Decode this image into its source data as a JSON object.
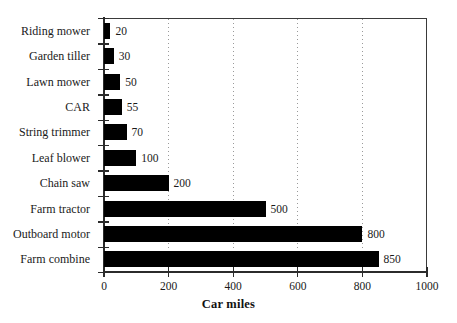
{
  "chart_data": {
    "type": "bar",
    "orientation": "horizontal",
    "title": "",
    "subtitle": "",
    "xlabel": "Car miles",
    "ylabel": "",
    "categories": [
      "Riding mower",
      "Garden tiller",
      "Lawn mower",
      "CAR",
      "String trimmer",
      "Leaf blower",
      "Chain saw",
      "Farm tractor",
      "Outboard motor",
      "Farm combine"
    ],
    "values": [
      20,
      30,
      50,
      55,
      70,
      100,
      200,
      500,
      800,
      850
    ],
    "value_labels": [
      "20",
      "30",
      "50",
      "55",
      "70",
      "100",
      "200",
      "500",
      "800",
      "850"
    ],
    "xlim": [
      0,
      1000
    ],
    "xticks": [
      0,
      200,
      400,
      600,
      800,
      1000
    ],
    "xtick_labels": [
      "0",
      "200",
      "400",
      "600",
      "800",
      "1000"
    ],
    "grid": true,
    "grid_axis": "x",
    "grid_style": "dotted",
    "legend": "none",
    "bar_color": "#000000",
    "grid_color": "#9a9a9a",
    "axis_color": "#2b2b2b",
    "background_color": "#ffffff"
  }
}
